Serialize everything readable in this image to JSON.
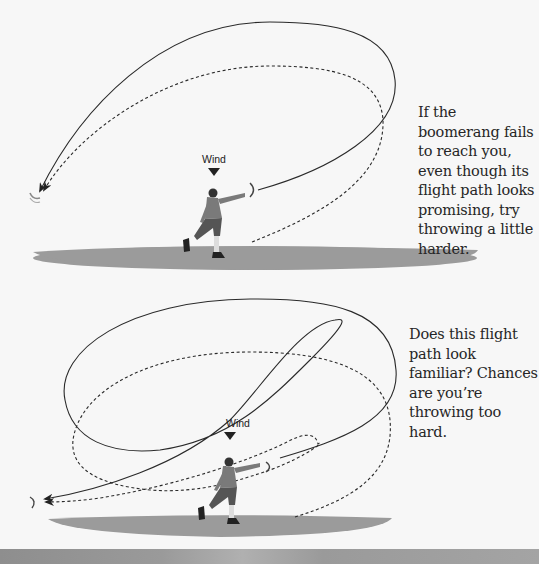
{
  "figures": [
    {
      "id": "figure-throw-too-soft",
      "wind_label": "Wind",
      "caption": "If the boomerang fails to reach you, even though its flight path looks promising, try throwing a little harder.",
      "paths": [
        "solid-outbound-path",
        "dashed-return-path"
      ]
    },
    {
      "id": "figure-throw-too-hard",
      "wind_label": "Wind",
      "caption": "Does this flight path look familiar? Chances are you’re throwing too hard.",
      "paths": [
        "solid-figure-eight-path",
        "dashed-loop-path"
      ]
    }
  ],
  "colors": {
    "background": "#f7f7f7",
    "ground_shadow": "#9a9a9a",
    "path_line": "#2a2a2a",
    "caption_text": "#262626"
  }
}
